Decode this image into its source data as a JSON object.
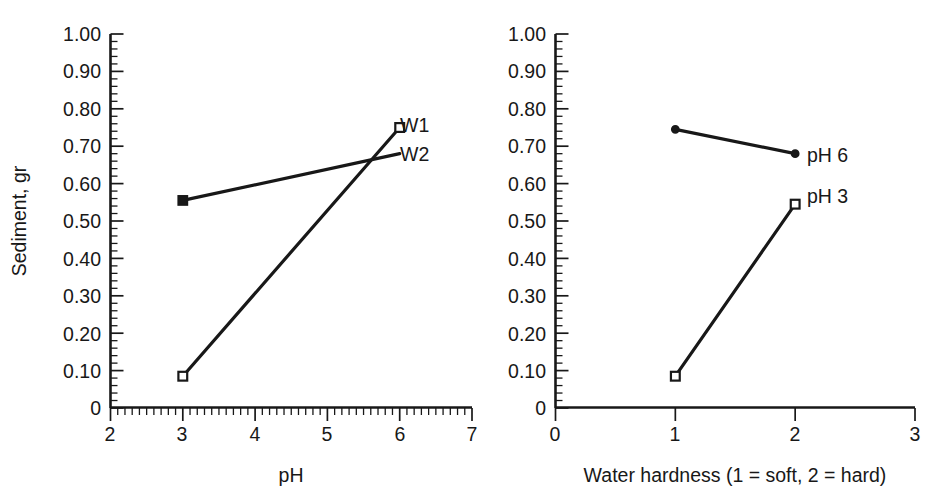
{
  "chart_data": [
    {
      "panel": "left",
      "type": "line",
      "title": "",
      "xlabel": "pH",
      "ylabel": "Sediment, gr",
      "xlim": [
        2,
        7
      ],
      "ylim": [
        0,
        1.0
      ],
      "xticks": [
        2,
        3,
        4,
        5,
        6,
        7
      ],
      "xtick_labels": [
        "2",
        "3",
        "4",
        "5",
        "6",
        "7"
      ],
      "yticks": [
        0,
        0.1,
        0.2,
        0.3,
        0.4,
        0.5,
        0.6,
        0.7,
        0.8,
        0.9,
        1.0
      ],
      "ytick_labels": [
        "0",
        "0.10",
        "0.20",
        "0.30",
        "0.40",
        "0.50",
        "0.60",
        "0.70",
        "0.80",
        "0.90",
        "1.00"
      ],
      "y_minor_step": 0.02,
      "x_minor_step": 0.1,
      "grid": false,
      "legend_position": "inline-right",
      "series": [
        {
          "name": "W1",
          "label": "W1",
          "marker": "open-square",
          "x": [
            3,
            6
          ],
          "values": [
            0.085,
            0.75
          ]
        },
        {
          "name": "W2",
          "label": "W2",
          "marker": "filled-square-start",
          "x": [
            3,
            6
          ],
          "values": [
            0.555,
            0.68
          ]
        }
      ]
    },
    {
      "panel": "right",
      "type": "line",
      "title": "",
      "xlabel": "Water hardness (1 = soft, 2 = hard)",
      "ylabel": "",
      "xlim": [
        0,
        3
      ],
      "ylim": [
        0,
        1.0
      ],
      "xticks": [
        0,
        1,
        2,
        3
      ],
      "xtick_labels": [
        "0",
        "1",
        "2",
        "3"
      ],
      "yticks": [
        0,
        0.1,
        0.2,
        0.3,
        0.4,
        0.5,
        0.6,
        0.7,
        0.8,
        0.9,
        1.0
      ],
      "ytick_labels": [
        "0",
        "0.10",
        "0.20",
        "0.30",
        "0.40",
        "0.50",
        "0.60",
        "0.70",
        "0.80",
        "0.90",
        "1.00"
      ],
      "y_minor_step": 0.02,
      "x_minor_step": null,
      "grid": false,
      "legend_position": "inline-right",
      "series": [
        {
          "name": "pH 6",
          "label": "pH 6",
          "marker": "filled-circle",
          "x": [
            1,
            2
          ],
          "values": [
            0.745,
            0.68
          ]
        },
        {
          "name": "pH 3",
          "label": "pH 3",
          "marker": "open-square",
          "x": [
            1,
            2
          ],
          "values": [
            0.085,
            0.545
          ]
        }
      ]
    }
  ],
  "left_panel": {
    "y_axis_title": "Sediment, gr",
    "x_axis_title": "pH",
    "ytick_labels": [
      "1.00",
      "0.90",
      "0.80",
      "0.70",
      "0.60",
      "0.50",
      "0.40",
      "0.30",
      "0.20",
      "0.10",
      "0"
    ],
    "xtick_labels": [
      "2",
      "3",
      "4",
      "5",
      "6",
      "7"
    ],
    "series_labels": [
      "W1",
      "W2"
    ]
  },
  "right_panel": {
    "y_axis_title": "",
    "x_axis_title": "Water hardness (1 = soft, 2 = hard)",
    "ytick_labels": [
      "1.00",
      "0.90",
      "0.80",
      "0.70",
      "0.60",
      "0.50",
      "0.40",
      "0.30",
      "0.20",
      "0.10",
      "0"
    ],
    "xtick_labels": [
      "0",
      "1",
      "2",
      "3"
    ],
    "series_labels": [
      "pH 6",
      "pH 3"
    ]
  },
  "colors": {
    "ink": "#181818",
    "background": "#ffffff"
  }
}
